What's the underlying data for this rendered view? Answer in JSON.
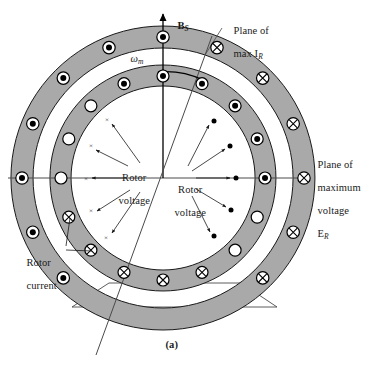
{
  "figure": {
    "title_caption": "(a)",
    "type": "induction-machine-cross-section",
    "colors": {
      "ring_fill": "#a9a9a9",
      "ring_stroke": "#1a1a1a",
      "line": "#4a4a4a",
      "text": "#1a1a1a",
      "page": "#ffffff",
      "conductor_fill_dark": "#000000",
      "conductor_fill_light": "#ffffff"
    },
    "labels": {
      "flux_axis": "B",
      "flux_axis_sub": "S",
      "omega": "ω",
      "omega_sub": "m",
      "plane_max_ir_line1": "Plane of",
      "plane_max_ir_line2": "max I",
      "plane_max_ir_sub": "R",
      "plane_max_voltage_line1": "Plane of",
      "plane_max_voltage_line2": "maximum",
      "plane_max_voltage_line3": "voltage",
      "plane_max_voltage_line4": "E",
      "plane_max_voltage_sub": "R",
      "rotor_voltage_left_line1": "Rotor",
      "rotor_voltage_left_line2": "voltage",
      "rotor_voltage_right_line1": "Rotor",
      "rotor_voltage_right_line2": "voltage",
      "rotor_current_line1": "Rotor",
      "rotor_current_line2": "current",
      "caption": "(a)"
    },
    "geometry": {
      "center_x": 163,
      "center_y": 178,
      "stator_outer_r": 152,
      "stator_inner_r": 130,
      "rotor_outer_r": 113,
      "rotor_inner_r": 92
    },
    "stator_conductors": {
      "count": 16,
      "radius": 141,
      "symbols": [
        "dot",
        "dot",
        "dot",
        "dot",
        "dot",
        "dot",
        "dot",
        "dot",
        "cross",
        "cross",
        "cross",
        "cross",
        "cross",
        "cross",
        "cross",
        "cross"
      ],
      "note": "dot = current out of page (left half), cross = current into page (right half)"
    },
    "rotor_conductors": {
      "count": 16,
      "radius": 102,
      "symbols": [
        "dot",
        "dot",
        "dot",
        "dot",
        "dot",
        "open",
        "open",
        "open",
        "cross",
        "cross",
        "cross",
        "cross",
        "cross",
        "open",
        "open",
        "open"
      ],
      "note": "dot = into-page winding marker, cross = out-of-page marker, open = null conductor"
    },
    "rotor_voltage_markers": {
      "left_symbol": "×",
      "left_count": 5,
      "right_symbol": "●",
      "right_count": 5,
      "radius": 76
    },
    "axes": {
      "vertical_label": "B_S",
      "horizontal_label": "Plane of maximum voltage E_R",
      "diagonal_label": "Plane of max I_R",
      "diagonal_angle_deg": 20
    }
  }
}
